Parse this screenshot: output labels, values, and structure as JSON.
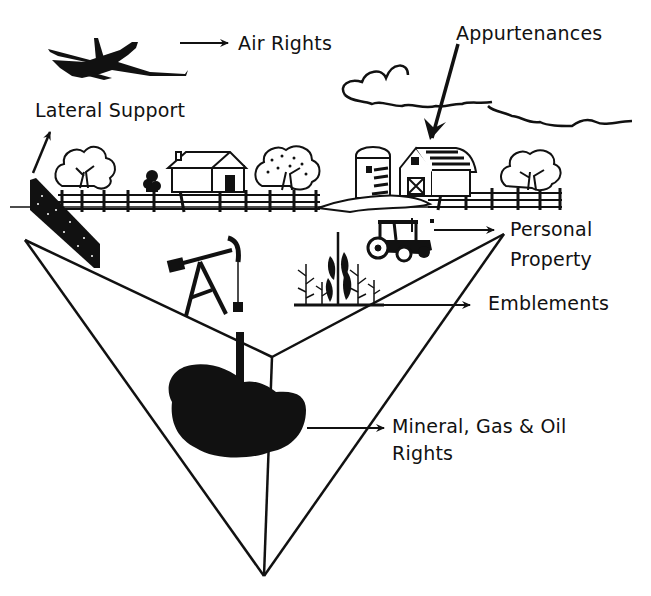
{
  "diagram": {
    "colors": {
      "ink": "#111111",
      "background": "#ffffff"
    },
    "labels": {
      "air_rights": "Air Rights",
      "appurtenances": "Appurtenances",
      "lateral_support": "Lateral Support",
      "personal_property_line1": "Personal",
      "personal_property_line2": "Property",
      "emblements": "Emblements",
      "mineral_line1": "Mineral, Gas & Oil",
      "mineral_line2": "Rights"
    },
    "illustrations": [
      "airplane-icon",
      "cloud-icon",
      "tree-icon",
      "house-icon",
      "silo-icon",
      "barn-icon",
      "fence-icon",
      "retaining-wall-icon",
      "oil-pump-jack-icon",
      "tractor-icon",
      "corn-crop-icon",
      "oil-deposit-icon",
      "land-wedge-shape"
    ]
  }
}
